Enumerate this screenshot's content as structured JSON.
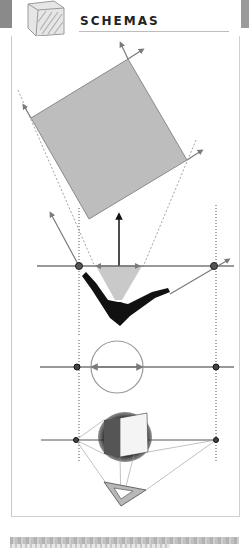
{
  "header": {
    "title": "SCHEMAS",
    "icon": "sketched-cube-icon"
  },
  "colors": {
    "line_gray": "#7a7a7a",
    "square_fill": "#bdbdbd",
    "cone_fill": "#c9c9c9",
    "figure_black": "#111111",
    "frame_border": "#c8c8c8",
    "background": "#ffffff"
  },
  "diagram": {
    "sections": [
      {
        "name": "rotated-square",
        "description": "Gray square rotated with directional arrows at corners"
      },
      {
        "name": "viewer-cone",
        "description": "Figure with arms outstretched, view cone, horizon line with two vanishing points and upward arrow"
      },
      {
        "name": "circle-horizon",
        "description": "Circle on horizon line with double arrow and two vanishing points"
      },
      {
        "name": "sketched-cube",
        "description": "Hand-sketched cube on horizon line with set-square triangle below"
      }
    ]
  }
}
